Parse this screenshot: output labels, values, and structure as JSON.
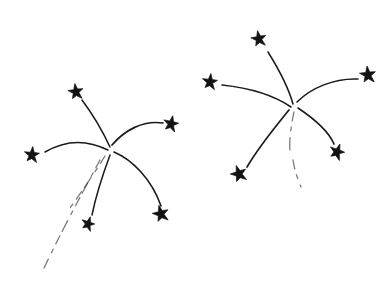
{
  "artwork": {
    "title": "Fireworks",
    "description": "Hand-drawn ink illustration of two firework bursts with star-tipped rays",
    "width": 390,
    "height": 286,
    "background_color": "#ffffff",
    "ink_color": "#1a1a1a",
    "faint_ink_color": "#4a4a4a",
    "star_color": "#121212"
  },
  "bursts": [
    {
      "name": "left-firework",
      "center": [
        110,
        148
      ],
      "rays": [
        {
          "name": "ray-upper-left",
          "path": "M110,147 C103,132 94,116 82,100",
          "width": 1.5,
          "faint": false
        },
        {
          "name": "ray-left",
          "path": "M108,150 C94,143 72,136 45,152",
          "width": 1.5,
          "faint": false
        },
        {
          "name": "ray-upper-right",
          "path": "M112,145 C124,131 142,120 163,123",
          "width": 1.7,
          "faint": false
        },
        {
          "name": "ray-lower-right",
          "path": "M114,152 C133,160 152,180 161,206",
          "width": 1.6,
          "faint": false
        },
        {
          "name": "ray-lower",
          "path": "M110,155 C103,174 96,195 92,215",
          "width": 1.5,
          "faint": false
        },
        {
          "name": "ray-lower-left-faint",
          "path": "M105,156 C95,172 83,190 70,208",
          "width": 1.3,
          "faint": true
        },
        {
          "name": "ray-tail-long",
          "path": "M100,160 C84,190 64,226 44,268",
          "width": 1.3,
          "faint": true
        }
      ],
      "stars": [
        {
          "name": "star-upper-left",
          "cx": 76,
          "cy": 92,
          "size": 17,
          "rotation": -8
        },
        {
          "name": "star-left",
          "cx": 32,
          "cy": 155,
          "size": 17,
          "rotation": 5
        },
        {
          "name": "star-upper-right",
          "cx": 171,
          "cy": 124,
          "size": 17,
          "rotation": 12
        },
        {
          "name": "star-lower-right",
          "cx": 161,
          "cy": 214,
          "size": 18,
          "rotation": -14
        },
        {
          "name": "star-lower",
          "cx": 88,
          "cy": 224,
          "size": 15,
          "rotation": 18
        }
      ]
    },
    {
      "name": "right-firework",
      "center": [
        293,
        105
      ],
      "rays": [
        {
          "name": "ray-up",
          "path": "M293,104 C288,86 278,68 268,52",
          "width": 1.5,
          "faint": false
        },
        {
          "name": "ray-left",
          "path": "M291,107 C275,96 250,88 222,85",
          "width": 1.6,
          "faint": false
        },
        {
          "name": "ray-upper-right",
          "path": "M297,102 C311,88 334,78 358,79",
          "width": 1.6,
          "faint": false
        },
        {
          "name": "ray-right-down",
          "path": "M298,108 C313,118 328,130 334,144",
          "width": 1.6,
          "faint": false
        },
        {
          "name": "ray-lower-left",
          "path": "M289,110 C276,126 260,145 247,167",
          "width": 1.7,
          "faint": false
        },
        {
          "name": "ray-down-faint-a",
          "path": "M294,112 C291,126 289,140 290,152",
          "width": 1.3,
          "faint": true
        },
        {
          "name": "ray-down-faint-b",
          "path": "M293,160 C295,172 298,180 301,187",
          "width": 1.3,
          "faint": true
        }
      ],
      "stars": [
        {
          "name": "star-top",
          "cx": 259,
          "cy": 39,
          "size": 17,
          "rotation": -10
        },
        {
          "name": "star-left",
          "cx": 210,
          "cy": 82,
          "size": 17,
          "rotation": 6
        },
        {
          "name": "star-upper-right",
          "cx": 368,
          "cy": 75,
          "size": 18,
          "rotation": -6
        },
        {
          "name": "star-right-lower",
          "cx": 337,
          "cy": 152,
          "size": 17,
          "rotation": 20
        },
        {
          "name": "star-lower-left",
          "cx": 239,
          "cy": 174,
          "size": 18,
          "rotation": -18
        }
      ]
    }
  ]
}
